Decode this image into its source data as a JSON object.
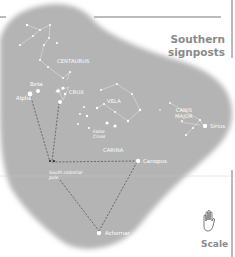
{
  "title": {
    "line1": "Southern",
    "line2": "signposts"
  },
  "scale": {
    "label": "Scale",
    "icon": "hand-icon"
  },
  "colors": {
    "sky": "#b4b4b4",
    "star": "#ffffff",
    "text_accent": "#8a8a8a",
    "rule": "#555555"
  },
  "constellations": {
    "centaurus": "CENTAURUS",
    "crux": "CRUX",
    "vela": "VELA",
    "carina": "CARINA",
    "canis_major": [
      "CANIS",
      "MAJOR"
    ]
  },
  "stars": {
    "beta": "Beta",
    "alpha": "Alpha",
    "canopus": "Canopus",
    "achernar": "Achernar",
    "sirius": "Sirius",
    "false_cross": [
      "False",
      "Cross"
    ]
  },
  "pole": {
    "line1": "South celestial",
    "line2": "pole"
  }
}
